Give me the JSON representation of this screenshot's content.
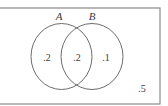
{
  "diagram": {
    "type": "venn",
    "border_color": "#8a8a8a",
    "circle_color": "#6e6e6e",
    "sets": [
      {
        "label": "A"
      },
      {
        "label": "B"
      }
    ],
    "regions": {
      "a_only": ".2",
      "a_and_b": ".2",
      "b_only": ".1",
      "outside": ".5"
    }
  }
}
